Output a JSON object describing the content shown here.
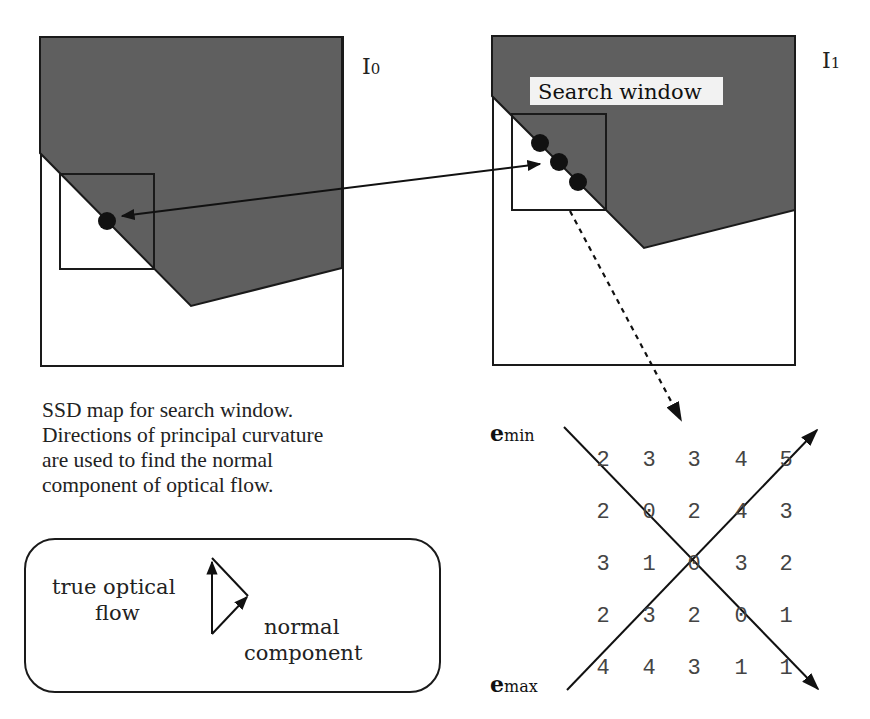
{
  "frames": {
    "left": {
      "label_main": "I",
      "label_sub": "0"
    },
    "right": {
      "label_main": "I",
      "label_sub": "1",
      "search_label": "Search window"
    }
  },
  "caption": {
    "lines": [
      "SSD map for search window.",
      "Directions of principal curvature",
      "are used to find the normal",
      "component of optical flow."
    ]
  },
  "legend": {
    "true_flow_line1": "true optical",
    "true_flow_line2": "flow",
    "normal_line1": "normal",
    "normal_line2": "component"
  },
  "ssd_map": {
    "emin_bold": "e",
    "emin_sub": "min",
    "emax_bold": "e",
    "emax_sub": "max",
    "grid": [
      [
        "2",
        "3",
        "3",
        "4",
        "5"
      ],
      [
        "2",
        "0",
        "2",
        "4",
        "3"
      ],
      [
        "3",
        "1",
        "0",
        "3",
        "2"
      ],
      [
        "2",
        "3",
        "2",
        "0",
        "1"
      ],
      [
        "4",
        "4",
        "3",
        "1",
        "1"
      ]
    ]
  },
  "colors": {
    "region_fill": "#5f5f5f",
    "stroke": "#1a1a1a",
    "grid_text": "#444444"
  }
}
